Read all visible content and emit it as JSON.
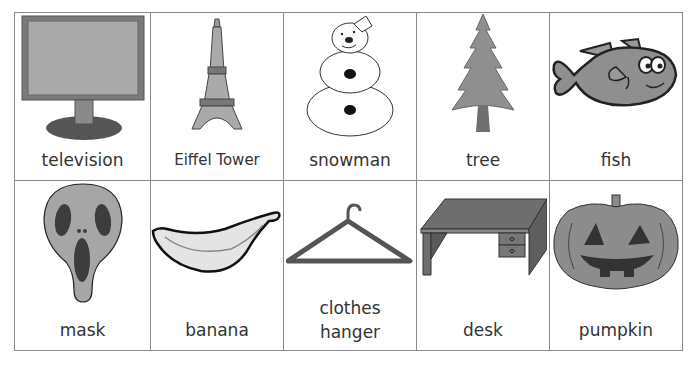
{
  "cards": [
    {
      "label": "television",
      "icon": "television-icon"
    },
    {
      "label": "Eiffel Tower",
      "icon": "eiffel-tower-icon"
    },
    {
      "label": "snowman",
      "icon": "snowman-icon"
    },
    {
      "label": "tree",
      "icon": "tree-icon"
    },
    {
      "label": "fish",
      "icon": "fish-icon"
    },
    {
      "label": "mask",
      "icon": "mask-icon"
    },
    {
      "label": "banana",
      "icon": "banana-icon"
    },
    {
      "label_line1": "clothes",
      "label_line2": "hanger",
      "icon": "clothes-hanger-icon"
    },
    {
      "label": "desk",
      "icon": "desk-icon"
    },
    {
      "label": "pumpkin",
      "icon": "pumpkin-icon"
    }
  ],
  "colors": {
    "border": "#8a8a8a",
    "fill_gray": "#8f8f8f",
    "dark_gray": "#555555",
    "text": "#333333"
  }
}
